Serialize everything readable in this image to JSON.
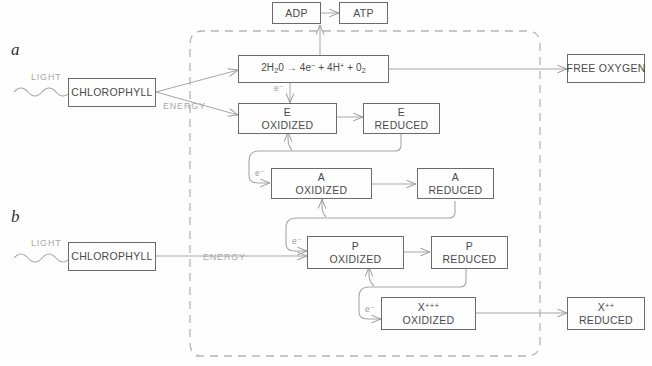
{
  "diagram": {
    "panels": [
      {
        "id": "a",
        "label": "a"
      },
      {
        "id": "b",
        "label": "b"
      }
    ],
    "colors": {
      "box_stroke": "#6b6b6b",
      "box_text": "#4a4a4a",
      "arrow": "#9a9a9a",
      "soft_text": "#a9a9a9",
      "dashed_boundary": "#b5b5b5",
      "background": "#fefefe"
    },
    "boundary": {
      "name": "chloroplast-boundary",
      "style": "dashed-rounded-rectangle"
    },
    "nodes": [
      {
        "name": "adp-box",
        "line1": "ADP",
        "line2": ""
      },
      {
        "name": "atp-box",
        "line1": "ATP",
        "line2": ""
      },
      {
        "name": "water-splitting-box",
        "line1": "2H₂0 → 4e⁻ + 4H⁺ + 0₂",
        "line2": ""
      },
      {
        "name": "free-oxygen-box",
        "line1": "FREE OXYGEN",
        "line2": ""
      },
      {
        "name": "chlorophyll-a-box",
        "line1": "CHLOROPHYLL",
        "line2": ""
      },
      {
        "name": "chlorophyll-b-box",
        "line1": "CHLOROPHYLL",
        "line2": ""
      },
      {
        "name": "e-oxidized-box",
        "line1": "E",
        "line2": "OXIDIZED"
      },
      {
        "name": "e-reduced-box",
        "line1": "E",
        "line2": "REDUCED"
      },
      {
        "name": "a-oxidized-box",
        "line1": "A",
        "line2": "OXIDIZED"
      },
      {
        "name": "a-reduced-box",
        "line1": "A",
        "line2": "REDUCED"
      },
      {
        "name": "p-oxidized-box",
        "line1": "P",
        "line2": "OXIDIZED"
      },
      {
        "name": "p-reduced-box",
        "line1": "P",
        "line2": "REDUCED"
      },
      {
        "name": "x3-oxidized-box",
        "line1": "X+++",
        "line2": "OXIDIZED"
      },
      {
        "name": "x2-reduced-box",
        "line1": "X++",
        "line2": "REDUCED"
      }
    ],
    "labels": {
      "light_a": "LIGHT",
      "light_b": "LIGHT",
      "energy_a": "ENERGY",
      "energy_b": "ENERGY",
      "electron_water": "e⁻",
      "electron_a": "e⁻",
      "electron_p": "e⁻",
      "electron_x": "e⁻"
    },
    "equation": {
      "reactant": "2H₂0",
      "arrow": "→",
      "products": "4e⁻ + 4H⁺ + 0₂"
    }
  }
}
